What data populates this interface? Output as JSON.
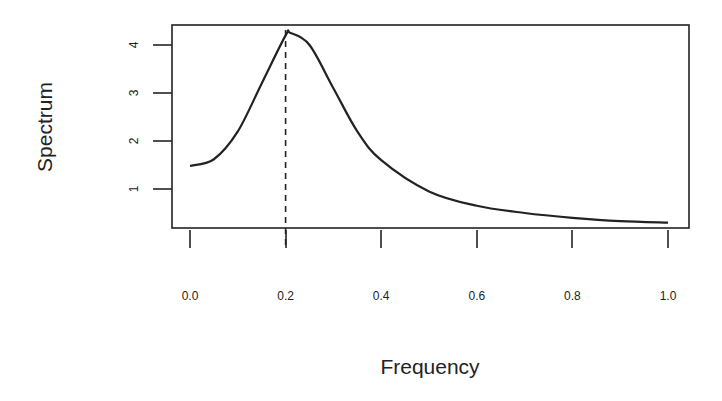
{
  "chart_data": {
    "type": "line",
    "title": "",
    "xlabel": "Frequency",
    "ylabel": "Spectrum",
    "xlim": [
      0.0,
      1.0
    ],
    "ylim": [
      0.25,
      4.4
    ],
    "x_ticks": [
      "0.0",
      "0.2",
      "0.4",
      "0.6",
      "0.8",
      "1.0"
    ],
    "y_ticks": [
      "1",
      "2",
      "3",
      "4"
    ],
    "grid": false,
    "legend": null,
    "series": [
      {
        "name": "Spectrum",
        "x": [
          0.0,
          0.05,
          0.1,
          0.15,
          0.2,
          0.21,
          0.25,
          0.3,
          0.35,
          0.4,
          0.5,
          0.6,
          0.7,
          0.8,
          0.9,
          1.0
        ],
        "values": [
          1.48,
          1.62,
          2.2,
          3.2,
          4.2,
          4.25,
          4.0,
          3.1,
          2.2,
          1.6,
          0.95,
          0.65,
          0.5,
          0.4,
          0.33,
          0.3
        ]
      }
    ],
    "annotations": [
      {
        "type": "vertical-dashed-line",
        "x": 0.2,
        "label": ""
      }
    ]
  }
}
